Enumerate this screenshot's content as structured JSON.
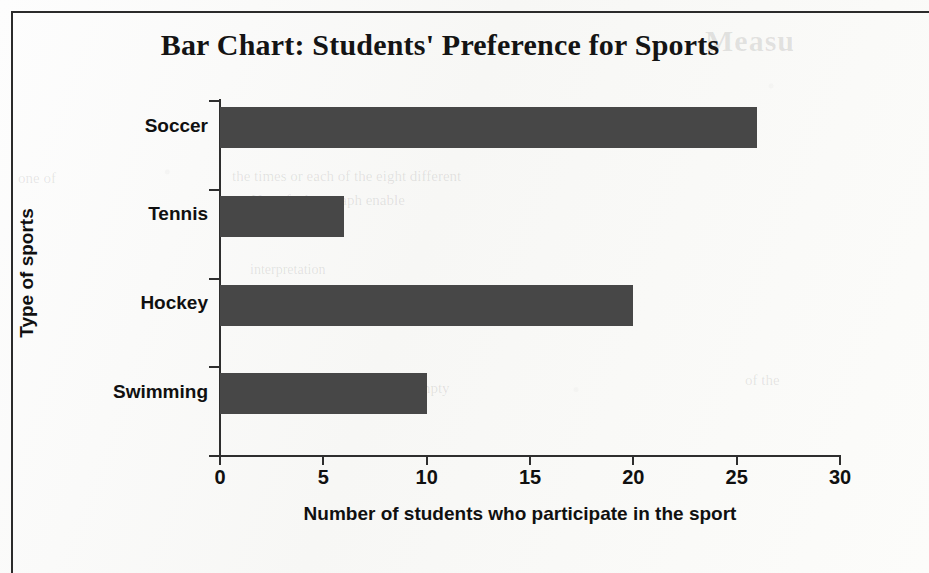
{
  "chart_data": {
    "type": "bar",
    "orientation": "horizontal",
    "title": "Bar Chart: Students' Preference for Sports",
    "xlabel": "Number of students who participate in the sport",
    "ylabel": "Type of sports",
    "categories": [
      "Soccer",
      "Tennis",
      "Hockey",
      "Swimming"
    ],
    "values": [
      26,
      6,
      20,
      10
    ],
    "xlim": [
      0,
      30
    ],
    "xticks": [
      "0",
      "5",
      "10",
      "15",
      "20",
      "25",
      "30"
    ],
    "xtick_values": [
      0,
      5,
      10,
      15,
      20,
      25,
      30
    ],
    "grid": false,
    "legend": false,
    "bar_color": "#474747",
    "axis_color": "#2e2e2e",
    "text_color": "#101010",
    "background_color": "#fbfbfb"
  },
  "page": {
    "border_color": "#2b2b2b",
    "ghost_text": {
      "title": "Measu",
      "line1": "one of",
      "line2": "the times or each of the eight different",
      "line3": "m. Use of a bar graph enable",
      "line4": "expre ssed in empty",
      "line5": "of the",
      "line6": "interpretation"
    }
  }
}
